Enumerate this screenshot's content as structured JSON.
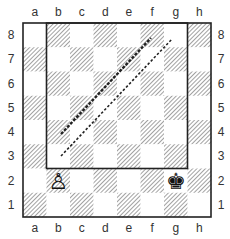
{
  "diagram": {
    "type": "chess-board",
    "files": [
      "a",
      "b",
      "c",
      "d",
      "e",
      "f",
      "g",
      "h"
    ],
    "ranks": [
      "8",
      "7",
      "6",
      "5",
      "4",
      "3",
      "2",
      "1"
    ],
    "board": {
      "x": 23,
      "y": 23,
      "width": 188,
      "height": 194
    },
    "light_square_color": "#ffffff",
    "dark_square_color": "#c8c8c8",
    "border_color": "#222222",
    "pieces": [
      {
        "square": "b2",
        "piece": "pawn",
        "color": "white",
        "glyph": "♙"
      },
      {
        "square": "g2",
        "piece": "king",
        "color": "black",
        "glyph": "♚"
      }
    ],
    "highlight_region": {
      "from_square": "b8",
      "to_square": "g3",
      "description": "rectangle outline b3–g8"
    },
    "dashed_lines": [
      {
        "id": "line-1",
        "from": [
          61,
          134
        ],
        "to": [
          151,
          38
        ],
        "style": "thick-dashed"
      },
      {
        "id": "line-2",
        "from": [
          61,
          156
        ],
        "to": [
          172,
          39
        ],
        "style": "thin-dashed"
      }
    ]
  }
}
